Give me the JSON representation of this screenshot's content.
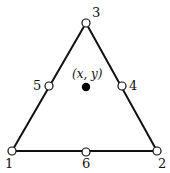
{
  "diagram": {
    "type": "triangle-element",
    "colors": {
      "stroke": "#111111",
      "node_fill": "#ffffff",
      "point_fill": "#000000",
      "background": "#ffffff"
    },
    "vertices": [
      {
        "id": "1",
        "label": "1",
        "x": 12,
        "y": 151
      },
      {
        "id": "2",
        "label": "2",
        "x": 157,
        "y": 151
      },
      {
        "id": "3",
        "label": "3",
        "x": 86,
        "y": 23
      }
    ],
    "midside_nodes": [
      {
        "id": "4",
        "label": "4",
        "x": 122,
        "y": 86
      },
      {
        "id": "5",
        "label": "5",
        "x": 49,
        "y": 86
      },
      {
        "id": "6",
        "label": "6",
        "x": 86,
        "y": 152
      }
    ],
    "interior_point": {
      "label": "(x, y)",
      "x": 86,
      "y": 87
    }
  }
}
